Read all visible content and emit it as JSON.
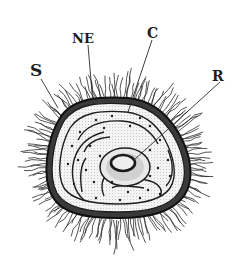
{
  "figure": {
    "colors": {
      "ink": "#1e1e1e",
      "paper": "#ffffff",
      "shade": "#d8d8d8"
    },
    "labels": [
      {
        "id": "S",
        "text": "S"
      },
      {
        "id": "NE",
        "text": "NE"
      },
      {
        "id": "C",
        "text": "C"
      },
      {
        "id": "R",
        "text": "R"
      }
    ]
  }
}
